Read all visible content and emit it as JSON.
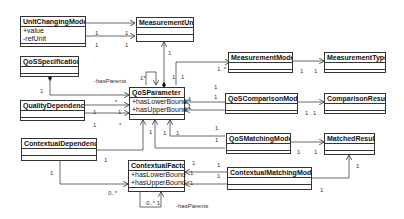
{
  "classes": {
    "unit_changing_model": {
      "name": "UnitChangingModel",
      "attrs": [
        "+value",
        "-refUnit"
      ]
    },
    "measurement_unit": {
      "name": "MeasurementUnit"
    },
    "qos_specification": {
      "name": "QoSSpecification"
    },
    "measurement_model": {
      "name": "MeasurementModel"
    },
    "measurement_type": {
      "name": "MeasurementType"
    },
    "qos_parameter": {
      "name": "QoSParameter",
      "attrs": [
        "+hasLowerBound",
        "+hasUpperBound"
      ]
    },
    "quality_dependency": {
      "name": "QualityDependency"
    },
    "qos_comparison_model": {
      "name": "QoSComparisonModel"
    },
    "comparison_result": {
      "name": "ComparisonResult"
    },
    "contextual_dependency": {
      "name": "ContextualDependency"
    },
    "qos_matching_model": {
      "name": "QoSMatchingModel"
    },
    "matched_result": {
      "name": "MatchedResult"
    },
    "contextual_factor": {
      "name": "ContextualFactor",
      "attrs": [
        "+hasLowerBound",
        "+hasUpperBound"
      ]
    },
    "contextual_matching_model": {
      "name": "ContextualMatchingModel"
    }
  },
  "labels": {
    "has_parents_qos": "-hasParents",
    "has_parents_ctx": "-hasParents",
    "self_mult_qos": "1*",
    "self_mult_ctx": "0..* 1",
    "m1": "1",
    "m2": "1",
    "m3": "1",
    "m4": "1",
    "m5": "1",
    "m6": "1..*",
    "m7": "1",
    "m8": "1",
    "m9": "1",
    "m10": "1",
    "m11": "1",
    "m12": "*",
    "m13": "1",
    "m14": "1",
    "m15": "1",
    "m16": "*",
    "m17": "1",
    "m18": "1",
    "m19": "1",
    "m20": "1",
    "m21": "1",
    "m22": "1",
    "m23": "1",
    "m24": "1",
    "m25": "1",
    "m26": "1",
    "m27": "1",
    "m28": "1",
    "m29": "1",
    "m30": "0..*",
    "m31": "1",
    "m32": "1",
    "m33": "1",
    "m34": "1",
    "m35": "1",
    "m36": "1",
    "m37": "1",
    "m38": "1",
    "m39": "1"
  }
}
